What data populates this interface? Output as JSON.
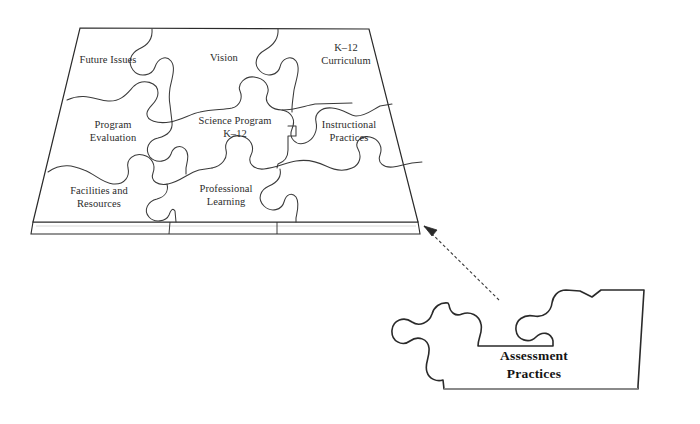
{
  "diagram": {
    "board": {
      "name": "science-program-puzzle-board",
      "shape": "trapezoid-platform",
      "rows": 3,
      "columns": 3,
      "pieces": [
        {
          "id": "future-issues",
          "label": "Future Issues",
          "row": 1,
          "col": 1,
          "x": 108,
          "y": 61
        },
        {
          "id": "vision",
          "label": "Vision",
          "row": 1,
          "col": 2,
          "x": 224,
          "y": 59
        },
        {
          "id": "k12-curriculum",
          "label": "K–12\nCurriculum",
          "row": 1,
          "col": 3,
          "x": 344,
          "y": 55
        },
        {
          "id": "program-evaluation",
          "label": "Program\nEvaluation",
          "row": 2,
          "col": 1,
          "x": 112,
          "y": 131
        },
        {
          "id": "science-program-k12",
          "label": "Science Program\nK–12",
          "row": 2,
          "col": 2,
          "x": 234,
          "y": 128
        },
        {
          "id": "instructional-practices",
          "label": "Instructional\nPractices",
          "row": 2,
          "col": 3,
          "x": 346,
          "y": 132
        },
        {
          "id": "facilities-and-resources",
          "label": "Facilities and\nResources",
          "row": 3,
          "col": 1,
          "x": 97,
          "y": 197
        },
        {
          "id": "professional-learning",
          "label": "Professional\nLearning",
          "row": 3,
          "col": 2,
          "x": 224,
          "y": 195
        },
        {
          "id": "empty-slot",
          "label": "",
          "row": 3,
          "col": 3,
          "x": 340,
          "y": 197
        }
      ]
    },
    "detached_piece": {
      "id": "assessment-practices",
      "label": "Assessment\nPractices",
      "x": 533,
      "y": 370
    },
    "connector": {
      "id": "assessment-arrow",
      "style": "dashed",
      "from": "assessment-practices",
      "to": "empty-slot"
    },
    "colors": {
      "background": "#ffffff",
      "outline": "#2a2a2a",
      "piece_outline": "#3a3a3a",
      "text": "#2b2b2b",
      "assessment_text": "#141414",
      "base_shadow": "#cfcfcf"
    }
  }
}
